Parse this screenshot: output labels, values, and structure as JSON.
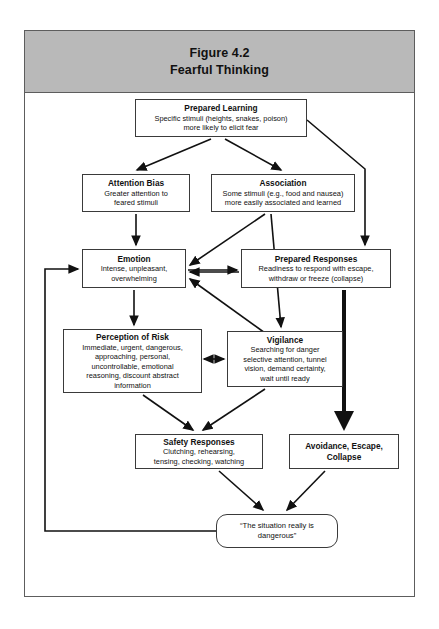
{
  "figure": {
    "number": "Figure 4.2",
    "title": "Fearful Thinking"
  },
  "diagram": {
    "type": "flowchart",
    "nodes": [
      {
        "id": "prepared-learning",
        "title": "Prepared Learning",
        "body": "Specific stimuli (heights, snakes, poison)\nmore likely to elicit fear",
        "shape": "rectangle"
      },
      {
        "id": "attention-bias",
        "title": "Attention Bias",
        "body": "Greater attention to\nfeared stimuli",
        "shape": "rectangle"
      },
      {
        "id": "association",
        "title": "Association",
        "body": "Some stimuli (e.g., food and nausea)\nmore easily associated and learned",
        "shape": "rectangle"
      },
      {
        "id": "emotion",
        "title": "Emotion",
        "body": "Intense, unpleasant,\noverwhelming",
        "shape": "rectangle"
      },
      {
        "id": "prepared-responses",
        "title": "Prepared Responses",
        "body": "Readiness to respond with escape,\nwithdraw or freeze (collapse)",
        "shape": "rectangle"
      },
      {
        "id": "perception-of-risk",
        "title": "Perception of Risk",
        "body": "Immediate, urgent, dangerous,\napproaching, personal,\nuncontrollable, emotional\nreasoning, discount abstract\ninformation",
        "shape": "rectangle"
      },
      {
        "id": "vigilance",
        "title": "Vigilance",
        "body": "Searching for danger\nselective attention, tunnel\nvision, demand certainty,\nwait until ready",
        "shape": "rectangle"
      },
      {
        "id": "safety-responses",
        "title": "Safety Responses",
        "body": "Clutching, rehearsing,\ntensing, checking, watching",
        "shape": "rectangle"
      },
      {
        "id": "avoidance-escape-collapse",
        "title": "Avoidance, Escape,\nCollapse",
        "body": "",
        "shape": "rectangle"
      },
      {
        "id": "situation-dangerous",
        "title": "“The situation really is\ndangerous”",
        "body": "",
        "shape": "rounded"
      }
    ],
    "edges": [
      {
        "from": "prepared-learning",
        "to": "attention-bias",
        "style": "single"
      },
      {
        "from": "prepared-learning",
        "to": "association",
        "style": "single"
      },
      {
        "from": "prepared-learning",
        "to": "prepared-responses",
        "style": "single"
      },
      {
        "from": "attention-bias",
        "to": "emotion",
        "style": "single"
      },
      {
        "from": "association",
        "to": "emotion",
        "style": "single"
      },
      {
        "from": "emotion",
        "to": "prepared-responses",
        "style": "single"
      },
      {
        "from": "prepared-responses",
        "to": "emotion",
        "style": "single"
      },
      {
        "from": "emotion",
        "to": "perception-of-risk",
        "style": "single"
      },
      {
        "from": "association",
        "to": "vigilance",
        "style": "single"
      },
      {
        "from": "vigilance",
        "to": "emotion",
        "style": "single"
      },
      {
        "from": "perception-of-risk",
        "to": "vigilance",
        "style": "double"
      },
      {
        "from": "perception-of-risk",
        "to": "safety-responses",
        "style": "single"
      },
      {
        "from": "vigilance",
        "to": "safety-responses",
        "style": "single"
      },
      {
        "from": "prepared-responses",
        "to": "avoidance-escape-collapse",
        "style": "thick"
      },
      {
        "from": "safety-responses",
        "to": "situation-dangerous",
        "style": "single"
      },
      {
        "from": "avoidance-escape-collapse",
        "to": "situation-dangerous",
        "style": "single"
      },
      {
        "from": "situation-dangerous",
        "to": "emotion",
        "style": "feedback-left"
      }
    ],
    "colors": {
      "header_background": "#b9b9b9",
      "frame_border": "#5d5d5d",
      "node_border": "#3a3a3a",
      "arrow": "#111111",
      "text": "#111111",
      "page_background": "#ffffff"
    }
  }
}
